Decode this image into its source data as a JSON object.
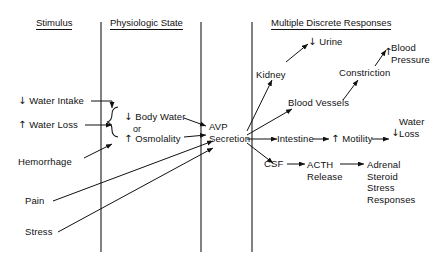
{
  "diagram": {
    "columns": [
      {
        "id": "stimulus",
        "header": "Stimulus"
      },
      {
        "id": "physiologic-state",
        "header": "Physiologic State"
      },
      {
        "id": "multiple-discrete-responses",
        "header": "Multiple Discrete Responses"
      }
    ],
    "arrow_glyphs": {
      "up": "↑",
      "down": "↓"
    },
    "nodes": {
      "water_intake": {
        "arrow": "↓",
        "text": "Water Intake"
      },
      "water_loss": {
        "arrow": "↑",
        "text": "Water Loss"
      },
      "hemorrhage": {
        "text": "Hemorrhage"
      },
      "pain": {
        "text": "Pain"
      },
      "stress": {
        "text": "Stress"
      },
      "body_water": {
        "arrow": "↓",
        "text": "Body Water"
      },
      "or": {
        "text": "or"
      },
      "osmolality": {
        "arrow": "↑",
        "text": "Osmolality"
      },
      "avp": {
        "line1": "AVP",
        "line2": "Secretion"
      },
      "kidney": {
        "text": "Kidney"
      },
      "urine": {
        "arrow": "↓",
        "text": "Urine"
      },
      "blood_vessels": {
        "text": "Blood Vessels"
      },
      "constriction": {
        "text": "Constriction"
      },
      "blood_pressure": {
        "arrow": "↑",
        "line1": "Blood",
        "line2": "Pressure"
      },
      "intestine": {
        "text": "Intestine"
      },
      "motility": {
        "arrow": "↑",
        "text": "Motility"
      },
      "water_loss_out": {
        "arrow": "↓",
        "line1": "Water",
        "line2": "Loss"
      },
      "csf": {
        "text": "CSF"
      },
      "acth": {
        "line1": "ACTH",
        "line2": "Release"
      },
      "adrenal": {
        "line1": "Adrenal",
        "line2": "Steroid",
        "line3": "Stress",
        "line4": "Responses"
      }
    },
    "colors": {
      "ink": "#111111",
      "background": "#ffffff"
    }
  }
}
